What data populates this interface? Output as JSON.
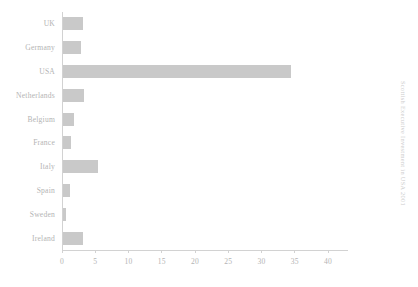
{
  "chart_data": {
    "type": "bar",
    "orientation": "horizontal",
    "title": "",
    "subtitle": "",
    "xlabel": "",
    "ylabel": "",
    "categories": [
      "UK",
      "Germany",
      "USA",
      "Netherlands",
      "Belgium",
      "France",
      "Italy",
      "Spain",
      "Sweden",
      "Ireland"
    ],
    "values": [
      3.0,
      2.8,
      34.5,
      3.2,
      1.7,
      1.2,
      5.3,
      1.0,
      0.5,
      3.0
    ],
    "series": [
      {
        "name": "",
        "values": [
          3.0,
          2.8,
          34.5,
          3.2,
          1.7,
          1.2,
          5.3,
          1.0,
          0.5,
          3.0
        ]
      }
    ],
    "xlim": [
      0,
      43
    ],
    "ylim": null,
    "xticks": [
      0,
      5,
      10,
      15,
      20,
      25,
      30,
      35,
      40
    ],
    "xtick_labels": [
      "0",
      "5",
      "10",
      "15",
      "20",
      "25",
      "30",
      "35",
      "40"
    ],
    "grid": false,
    "legend": null,
    "legend_position": "none",
    "bar_color": "#c9c9c9",
    "axis_color": "#d2d2d2",
    "text_color": "#b4b4b4",
    "background": "#ffffff",
    "annotations": []
  },
  "side_caption": {
    "text": "Scottish Executive Investment in USA 2001",
    "color": "#cccccc"
  }
}
